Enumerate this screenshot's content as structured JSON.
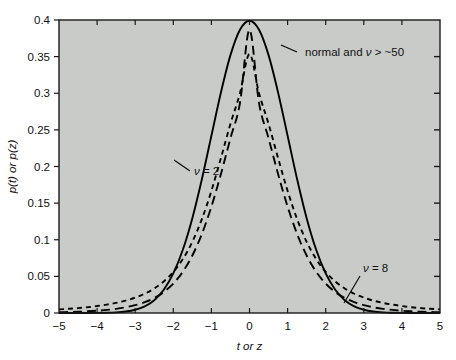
{
  "figure": {
    "background": "#ffffff",
    "plot_background": "#c9cbc9",
    "frame_color": "#1a1a1a",
    "curve_color": "#000000"
  },
  "chart_data": {
    "type": "line",
    "title": "",
    "xlabel": "t or z",
    "ylabel": "p(t) or p(z)",
    "xlim": [
      -5,
      5
    ],
    "ylim": [
      0,
      0.4
    ],
    "xticks": [
      -5,
      -4,
      -3,
      -2,
      -1,
      0,
      1,
      2,
      3,
      4,
      5
    ],
    "xticklabels": [
      "−5",
      "−4",
      "−3",
      "−2",
      "−1",
      "0",
      "1",
      "2",
      "3",
      "4",
      "5"
    ],
    "yticks": [
      0,
      0.05,
      0.1,
      0.15,
      0.2,
      0.25,
      0.3,
      0.35,
      0.4
    ],
    "yticklabels": [
      "0",
      "0.05",
      "0.1",
      "0.15",
      "0.2",
      "0.25",
      "0.3",
      "0.35",
      "0.4"
    ],
    "grid": false,
    "legend_position": "inline-annotations",
    "tick_direction": "in",
    "series": [
      {
        "name": "normal and ν > ~50",
        "style": "solid",
        "peak": 0.399,
        "x": [
          -5,
          -4.75,
          -4.5,
          -4.25,
          -4,
          -3.75,
          -3.5,
          -3.25,
          -3,
          -2.75,
          -2.5,
          -2.25,
          -2,
          -1.75,
          -1.5,
          -1.25,
          -1,
          -0.75,
          -0.5,
          -0.25,
          0,
          0.25,
          0.5,
          0.75,
          1,
          1.25,
          1.5,
          1.75,
          2,
          2.25,
          2.5,
          2.75,
          3,
          3.25,
          3.5,
          3.75,
          4,
          4.25,
          4.5,
          4.75,
          5
        ],
        "y": [
          1.5e-06,
          5e-06,
          1.6e-05,
          4.65e-05,
          0.0001338,
          0.000346,
          0.0008727,
          0.0020297,
          0.0044318,
          0.0090936,
          0.0175283,
          0.0317397,
          0.053991,
          0.0862773,
          0.1295176,
          0.1826491,
          0.2419707,
          0.3011374,
          0.3520653,
          0.3866681,
          0.3989423,
          0.3866681,
          0.3520653,
          0.3011374,
          0.2419707,
          0.1826491,
          0.1295176,
          0.0862773,
          0.053991,
          0.0317397,
          0.0175283,
          0.0090936,
          0.0044318,
          0.0020297,
          0.0008727,
          0.000346,
          0.0001338,
          4.65e-05,
          1.6e-05,
          5e-06,
          1.5e-06
        ]
      },
      {
        "name": "ν = 8",
        "style": "long-dash",
        "peak": 0.3867,
        "x": [
          -5,
          -4.75,
          -4.5,
          -4.25,
          -4,
          -3.75,
          -3.5,
          -3.25,
          -3,
          -2.75,
          -2.5,
          -2.25,
          -2,
          -1.75,
          -1.5,
          -1.25,
          -1,
          -0.75,
          -0.5,
          -0.25,
          0,
          0.25,
          0.5,
          0.75,
          1,
          1.25,
          1.5,
          1.75,
          2,
          2.25,
          2.5,
          2.75,
          3,
          3.25,
          3.5,
          3.75,
          4,
          4.25,
          4.5,
          4.75,
          5
        ],
        "y": [
          0.001,
          0.0013,
          0.0017,
          0.0023,
          0.0031,
          0.0042,
          0.0057,
          0.0078,
          0.0107,
          0.0148,
          0.0205,
          0.0286,
          0.0401,
          0.0563,
          0.0785,
          0.1079,
          0.1452,
          0.1897,
          0.2386,
          0.2867,
          0.3867,
          0.2867,
          0.2386,
          0.1897,
          0.1452,
          0.1079,
          0.0785,
          0.0563,
          0.0401,
          0.0286,
          0.0205,
          0.0148,
          0.0107,
          0.0078,
          0.0057,
          0.0042,
          0.0031,
          0.0023,
          0.0017,
          0.0013,
          0.001
        ]
      },
      {
        "name": "ν = 2",
        "style": "short-dash",
        "peak": 0.3536,
        "x": [
          -5,
          -4.75,
          -4.5,
          -4.25,
          -4,
          -3.75,
          -3.5,
          -3.25,
          -3,
          -2.75,
          -2.5,
          -2.25,
          -2,
          -1.75,
          -1.5,
          -1.25,
          -1,
          -0.75,
          -0.5,
          -0.25,
          0,
          0.25,
          0.5,
          0.75,
          1,
          1.25,
          1.5,
          1.75,
          2,
          2.25,
          2.5,
          2.75,
          3,
          3.25,
          3.5,
          3.75,
          4,
          4.25,
          4.5,
          4.75,
          5
        ],
        "y": [
          0.0049,
          0.0057,
          0.0067,
          0.0079,
          0.0095,
          0.0114,
          0.0138,
          0.0169,
          0.021,
          0.0263,
          0.0334,
          0.043,
          0.056,
          0.0736,
          0.0972,
          0.1281,
          0.1667,
          0.2116,
          0.2582,
          0.3001,
          0.3536,
          0.3001,
          0.2582,
          0.2116,
          0.1667,
          0.1281,
          0.0972,
          0.0736,
          0.056,
          0.043,
          0.0334,
          0.0263,
          0.021,
          0.0169,
          0.0138,
          0.0114,
          0.0095,
          0.0079,
          0.0067,
          0.0057,
          0.0049
        ]
      }
    ],
    "annotations": [
      {
        "id": "normal",
        "text_plain": "normal and ν > ~50",
        "prefix": "normal and ",
        "symbol": "ν",
        "suffix": " > ~50",
        "anchor_x": 0.15,
        "anchor_y": 0.372
      },
      {
        "id": "nu2",
        "text_plain": "ν = 2",
        "prefix": "",
        "symbol": "ν",
        "suffix": " = 2",
        "anchor_x": -1.05,
        "anchor_y": 0.233
      },
      {
        "id": "nu8",
        "text_plain": "ν = 8",
        "prefix": "",
        "symbol": "ν",
        "suffix": " = 8",
        "anchor_x": 2.95,
        "anchor_y": 0.043
      }
    ]
  }
}
